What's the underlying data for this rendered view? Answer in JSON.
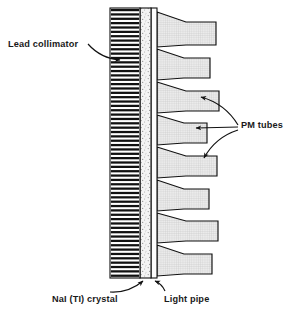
{
  "figure": {
    "type": "labeled-cross-section-diagram",
    "background_color": "#ffffff",
    "line_color": "#111111"
  },
  "labels": {
    "lead_collimator": "Lead collimator",
    "pm_tubes": "PM tubes",
    "nai_crystal": "NaI (TI) crystal",
    "light_pipe": "Light pipe"
  },
  "components": {
    "collimator": {
      "name": "Lead collimator",
      "x": 110,
      "y": 8,
      "width": 30,
      "height": 270,
      "fill": "#ffffff",
      "septa_color": "#111111",
      "septa_count": 62,
      "pattern": "horizontal-lead-septa"
    },
    "crystal": {
      "name": "NaI (TI) crystal",
      "x": 140,
      "y": 8,
      "width": 11,
      "height": 270,
      "fill": "#f2f2f2",
      "pattern": "stipple-dots"
    },
    "light_pipe": {
      "name": "Light pipe",
      "x": 151,
      "y": 8,
      "width": 6,
      "height": 270,
      "fill": "#fdfdfd",
      "pattern": "plain"
    },
    "pm_tubes": {
      "name": "PM tubes",
      "count": 8,
      "fill": "#e8e8e8",
      "pattern": "fine-crosshatch",
      "face_x": 157,
      "geometry": [
        {
          "index": 1,
          "face_top": 12,
          "face_bottom": 47,
          "neck_top": 22,
          "neck_bottom": 45,
          "tip_x": 216,
          "taper_x": 186
        },
        {
          "index": 2,
          "face_top": 49,
          "face_bottom": 80,
          "neck_top": 58,
          "neck_bottom": 78,
          "tip_x": 210,
          "taper_x": 184
        },
        {
          "index": 3,
          "face_top": 82,
          "face_bottom": 113,
          "neck_top": 91,
          "neck_bottom": 111,
          "tip_x": 219,
          "taper_x": 186
        },
        {
          "index": 4,
          "face_top": 115,
          "face_bottom": 145,
          "neck_top": 123,
          "neck_bottom": 143,
          "tip_x": 207,
          "taper_x": 184
        },
        {
          "index": 5,
          "face_top": 147,
          "face_bottom": 178,
          "neck_top": 156,
          "neck_bottom": 176,
          "tip_x": 217,
          "taper_x": 186
        },
        {
          "index": 6,
          "face_top": 180,
          "face_bottom": 211,
          "neck_top": 189,
          "neck_bottom": 209,
          "tip_x": 209,
          "taper_x": 184
        },
        {
          "index": 7,
          "face_top": 213,
          "face_bottom": 243,
          "neck_top": 221,
          "neck_bottom": 241,
          "tip_x": 218,
          "taper_x": 186
        },
        {
          "index": 8,
          "face_top": 245,
          "face_bottom": 276,
          "neck_top": 254,
          "neck_bottom": 274,
          "tip_x": 212,
          "taper_x": 184
        }
      ]
    }
  },
  "leaders": {
    "lead_collimator": {
      "from_x": 88,
      "from_y": 44,
      "to_x": 120,
      "to_y": 60,
      "style": "curved-arrow"
    },
    "pm_tubes_fan": [
      {
        "from_x": 238,
        "from_y": 125,
        "to_x": 201,
        "to_y": 97,
        "style": "curved-arrow"
      },
      {
        "from_x": 238,
        "from_y": 127,
        "to_x": 196,
        "to_y": 128,
        "style": "straight-arrow"
      },
      {
        "from_x": 238,
        "from_y": 130,
        "to_x": 204,
        "to_y": 158,
        "style": "curved-arrow"
      }
    ],
    "nai_crystal": {
      "from_x": 110,
      "from_y": 292,
      "to_x": 143,
      "to_y": 281,
      "style": "curved-arrow"
    },
    "light_pipe": {
      "from_x": 165,
      "from_y": 291,
      "to_x": 155,
      "to_y": 281,
      "style": "curved-arrow"
    }
  }
}
